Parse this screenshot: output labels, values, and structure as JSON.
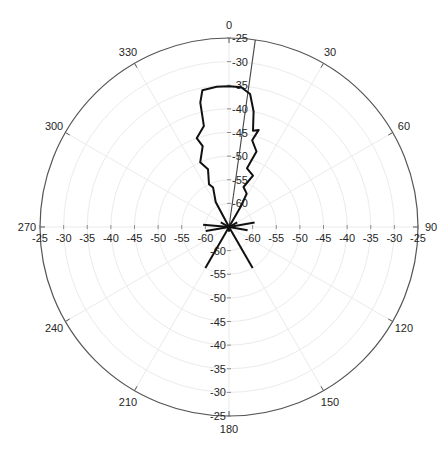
{
  "chart_data": {
    "type": "polar-line",
    "title": "",
    "angle_unit": "degrees",
    "angle_zero": "top",
    "angle_direction": "clockwise",
    "angle_ticks": [
      0,
      30,
      60,
      90,
      120,
      150,
      180,
      210,
      240,
      270,
      300,
      330
    ],
    "angle_tick_labels": [
      "0",
      "30",
      "60",
      "90",
      "120",
      "150",
      "180",
      "210",
      "240",
      "270",
      "300",
      "330"
    ],
    "radial_range": [
      -65,
      -25
    ],
    "radial_ticks": [
      -25,
      -30,
      -35,
      -40,
      -45,
      -50,
      -55,
      -60,
      -65
    ],
    "radial_tick_labels": [
      "-25",
      "-30",
      "-35",
      "-40",
      "-45",
      "-50",
      "-55",
      "-60",
      "-65"
    ],
    "grid": true,
    "legend": null,
    "beam_direction_deg": 8,
    "series": [
      {
        "name": "radiation pattern",
        "color": "#111111",
        "points": [
          {
            "angle": 0,
            "r": -35.2
          },
          {
            "angle": 5,
            "r": -35.3
          },
          {
            "angle": 9,
            "r": -36.5
          },
          {
            "angle": 12,
            "r": -40
          },
          {
            "angle": 14,
            "r": -44
          },
          {
            "angle": 17,
            "r": -43.5
          },
          {
            "angle": 15,
            "r": -46
          },
          {
            "angle": 20,
            "r": -48
          },
          {
            "angle": 17,
            "r": -52
          },
          {
            "angle": 25,
            "r": -53
          },
          {
            "angle": 20,
            "r": -56
          },
          {
            "angle": 28,
            "r": -57
          },
          {
            "angle": 30,
            "r": -60
          },
          {
            "angle": 60,
            "r": -63
          },
          {
            "angle": 80,
            "r": -59.5
          },
          {
            "angle": 100,
            "r": -61
          },
          {
            "angle": 150,
            "r": -55
          },
          {
            "angle": 180,
            "r": -64
          },
          {
            "angle": 210,
            "r": -55
          },
          {
            "angle": 260,
            "r": -60
          },
          {
            "angle": 275,
            "r": -59.5
          },
          {
            "angle": 300,
            "r": -63
          },
          {
            "angle": 332,
            "r": -59
          },
          {
            "angle": 338,
            "r": -56
          },
          {
            "angle": 335,
            "r": -55
          },
          {
            "angle": 340,
            "r": -52
          },
          {
            "angle": 336,
            "r": -50
          },
          {
            "angle": 342,
            "r": -47
          },
          {
            "angle": 340,
            "r": -45
          },
          {
            "angle": 346,
            "r": -43
          },
          {
            "angle": 347,
            "r": -38
          },
          {
            "angle": 349,
            "r": -35.5
          },
          {
            "angle": 355,
            "r": -35.2
          },
          {
            "angle": 360,
            "r": -35.2
          }
        ]
      }
    ]
  },
  "labels": {
    "angles": [
      "0",
      "30",
      "60",
      "90",
      "120",
      "150",
      "180",
      "210",
      "240",
      "270",
      "300",
      "330"
    ],
    "radial_up": [
      "-25",
      "-30",
      "-35",
      "-40",
      "-45",
      "-50",
      "-55",
      "-60",
      "-65"
    ],
    "radial_down": [
      "-25",
      "-30",
      "-35",
      "-40",
      "-45",
      "-50",
      "-55",
      "-60",
      "-65"
    ],
    "radial_left": [
      "-25",
      "-30",
      "-35",
      "-40",
      "-45",
      "-50",
      "-55",
      "-60",
      "-65"
    ],
    "radial_right": [
      "-25",
      "-30",
      "-35",
      "-40",
      "-45",
      "-50",
      "-55",
      "-60",
      "-65"
    ]
  }
}
